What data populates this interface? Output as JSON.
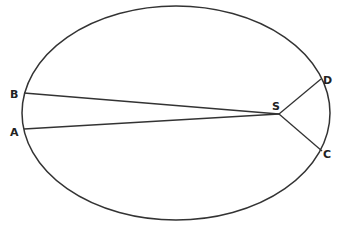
{
  "diagram": {
    "type": "ellipse-orbit",
    "stroke_color": "#333333",
    "background": "#ffffff",
    "ellipse": {
      "cx": 176,
      "cy": 113,
      "rx": 154,
      "ry": 107
    },
    "focus": {
      "label": "S",
      "x": 279,
      "y": 114
    },
    "points": [
      {
        "label": "B",
        "x": 24,
        "y": 94
      },
      {
        "label": "A",
        "x": 24,
        "y": 129
      },
      {
        "label": "D",
        "x": 320,
        "y": 79
      },
      {
        "label": "C",
        "x": 321,
        "y": 151
      }
    ],
    "labels": {
      "B": "B",
      "A": "A",
      "S": "S",
      "D": "D",
      "C": "C"
    }
  }
}
